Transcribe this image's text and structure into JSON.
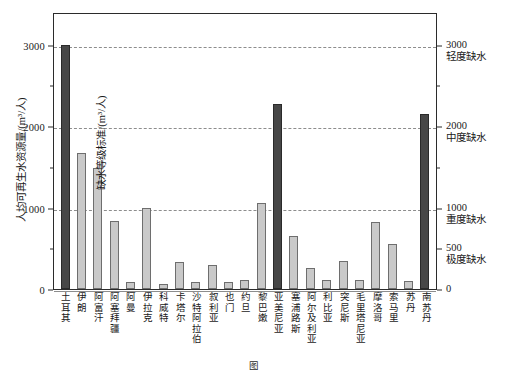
{
  "chart_data": {
    "type": "bar",
    "title": "",
    "xlabel": "",
    "ylabel": "人均可再生水资源量/(m³/人)",
    "y2label": "缺水等级标准/(m³/人)",
    "ylim": [
      0,
      3400
    ],
    "yticks": [
      0,
      1000,
      2000,
      3000
    ],
    "yticklabels": [
      "0",
      "1000",
      "2000",
      "3000"
    ],
    "yminorticks": [
      500,
      1500,
      2500
    ],
    "y2ticks": [
      0,
      500,
      1000,
      2000,
      3000
    ],
    "y2ticklabels": [
      "0",
      "500",
      "1000",
      "2000",
      "3000"
    ],
    "grid": true,
    "grid_axis": "y",
    "legend": "none",
    "categories": [
      "土耳其",
      "伊朗",
      "阿富汗",
      "阿塞拜疆",
      "阿曼",
      "伊拉克",
      "科威特",
      "卡塔尔",
      "沙特阿拉伯",
      "叙利亚",
      "也门",
      "约旦",
      "黎巴嫩",
      "亚美尼亚",
      "塞浦路斯",
      "阿尔及利亚",
      "利比亚",
      "突尼斯",
      "毛里塔尼亚",
      "摩洛哥",
      "索马里",
      "苏丹",
      "南苏丹"
    ],
    "values": [
      2990,
      1670,
      1490,
      840,
      90,
      1000,
      60,
      330,
      90,
      300,
      90,
      110,
      1050,
      2270,
      650,
      260,
      110,
      350,
      110,
      820,
      550,
      100,
      2150
    ],
    "highlighted": [
      "土耳其",
      "亚美尼亚",
      "南苏丹"
    ]
  },
  "axes": {
    "left": {
      "title": "人均可再生水资源量/(m³/人)",
      "ticks": [
        {
          "value": 3000,
          "label": "3000",
          "major": true
        },
        {
          "value": 2500,
          "label": "",
          "major": false
        },
        {
          "value": 2000,
          "label": "2000",
          "major": true
        },
        {
          "value": 1500,
          "label": "",
          "major": false
        },
        {
          "value": 1000,
          "label": "1000",
          "major": true
        },
        {
          "value": 500,
          "label": "",
          "major": false
        },
        {
          "value": 0,
          "label": "0",
          "major": true
        }
      ]
    },
    "right": {
      "title": "缺水等级标准/(m³/人)",
      "ticks": [
        {
          "value": 3000,
          "number": "3000",
          "level": "轻度缺水",
          "major": true
        },
        {
          "value": 2500,
          "number": "",
          "level": "",
          "major": false
        },
        {
          "value": 2000,
          "number": "2000",
          "level": "中度缺水",
          "major": true
        },
        {
          "value": 1500,
          "number": "",
          "level": "",
          "major": false
        },
        {
          "value": 1000,
          "number": "1000",
          "level": "重度缺水",
          "major": true
        },
        {
          "value": 500,
          "number": "500",
          "level": "极度缺水",
          "major": true
        },
        {
          "value": 0,
          "number": "0",
          "level": "",
          "major": true
        }
      ]
    }
  },
  "colors": {
    "bar_normal_fill": "#c9c9c9",
    "bar_normal_edge": "#6e6e6e",
    "bar_highlight_fill": "#474747",
    "bar_highlight_edge": "#2a2a2a",
    "frame": "#2b2b2b",
    "grid": "#8d8d8d",
    "background": "#ffffff"
  },
  "caption": "图"
}
